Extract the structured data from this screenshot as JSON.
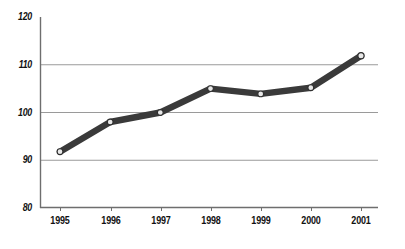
{
  "chart_data": {
    "type": "line",
    "title": "",
    "subtitle": "",
    "xlabel": "",
    "ylabel": "",
    "categories": [
      "1995",
      "1996",
      "1997",
      "1998",
      "1999",
      "2000",
      "2001"
    ],
    "x": [
      1995,
      1996,
      1997,
      1998,
      1999,
      2000,
      2001
    ],
    "series": [
      {
        "name": "Index",
        "values": [
          91.8,
          98.0,
          100.0,
          105.0,
          103.9,
          105.2,
          111.9
        ]
      }
    ],
    "values": [
      91.8,
      98.0,
      100.0,
      105.0,
      103.9,
      105.2,
      111.9
    ],
    "ylim": [
      80,
      120
    ],
    "xlim": [
      1995,
      2001
    ],
    "yticks": [
      80,
      90,
      100,
      110,
      120
    ],
    "ytick_labels": [
      "80",
      "90",
      "100",
      "110",
      "120"
    ],
    "xtick_labels": [
      "1995",
      "1996",
      "1997",
      "1998",
      "1999",
      "2000",
      "2001"
    ],
    "grid": "horizontal",
    "gridlines_at": [
      90,
      100,
      110
    ],
    "legend": "none",
    "annotations": [],
    "marker": "circle-open",
    "colors": {
      "line": "#3a3a3a",
      "marker_fill": "#e8e8e8",
      "marker_edge": "#2f2f2f",
      "gridline": "#9a9a9a",
      "axis": "#6e6e6e",
      "text": "#111111",
      "background": "#ffffff"
    }
  },
  "axes": {
    "y_labels": [
      {
        "text": "120"
      },
      {
        "text": "110"
      },
      {
        "text": "100"
      },
      {
        "text": "90"
      },
      {
        "text": "80"
      }
    ],
    "x_labels": [
      {
        "text": "1995"
      },
      {
        "text": "1996"
      },
      {
        "text": "1997"
      },
      {
        "text": "1998"
      },
      {
        "text": "1999"
      },
      {
        "text": "2000"
      },
      {
        "text": "2001"
      }
    ]
  }
}
